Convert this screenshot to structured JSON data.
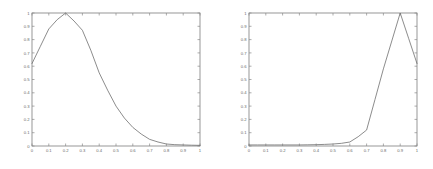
{
  "figure": {
    "background_color": "#ffffff",
    "line_color": "#6e6e6e",
    "axis_color": "#7d7d7d",
    "label_color": "#6a6a6a"
  },
  "chart_data": [
    {
      "type": "line",
      "title": "",
      "xlabel": "",
      "ylabel": "",
      "xlim": [
        0,
        1
      ],
      "ylim": [
        0,
        1
      ],
      "grid": false,
      "legend": null,
      "xticks": [
        "0",
        "0.1",
        "0.2",
        "0.3",
        "0.4",
        "0.5",
        "0.6",
        "0.7",
        "0.8",
        "0.9",
        "1"
      ],
      "yticks": [
        "0",
        "0.1",
        "0.2",
        "0.3",
        "0.4",
        "0.5",
        "0.6",
        "0.7",
        "0.8",
        "0.9",
        "1"
      ],
      "x": [
        0,
        0.05,
        0.1,
        0.15,
        0.2,
        0.25,
        0.3,
        0.35,
        0.4,
        0.45,
        0.5,
        0.55,
        0.6,
        0.65,
        0.7,
        0.75,
        0.8,
        0.85,
        0.9,
        0.95,
        1
      ],
      "values": [
        0.62,
        0.75,
        0.88,
        0.95,
        1.0,
        0.94,
        0.87,
        0.72,
        0.55,
        0.42,
        0.3,
        0.21,
        0.14,
        0.09,
        0.05,
        0.03,
        0.015,
        0.01,
        0.008,
        0.006,
        0.005
      ]
    },
    {
      "type": "line",
      "title": "",
      "xlabel": "",
      "ylabel": "",
      "xlim": [
        0,
        1
      ],
      "ylim": [
        0,
        1
      ],
      "grid": false,
      "legend": null,
      "xticks": [
        "0",
        "0.1",
        "0.2",
        "0.3",
        "0.4",
        "0.5",
        "0.6",
        "0.7",
        "0.8",
        "0.9",
        "1"
      ],
      "yticks": [
        "0",
        "0.1",
        "0.2",
        "0.3",
        "0.4",
        "0.5",
        "0.6",
        "0.7",
        "0.8",
        "0.9",
        "1"
      ],
      "x": [
        0,
        0.05,
        0.1,
        0.15,
        0.2,
        0.25,
        0.3,
        0.35,
        0.4,
        0.45,
        0.5,
        0.55,
        0.6,
        0.65,
        0.7,
        0.75,
        0.8,
        0.85,
        0.9,
        0.95,
        1
      ],
      "values": [
        0.008,
        0.008,
        0.008,
        0.008,
        0.008,
        0.008,
        0.008,
        0.009,
        0.01,
        0.012,
        0.015,
        0.02,
        0.03,
        0.07,
        0.12,
        0.35,
        0.58,
        0.79,
        1.0,
        0.81,
        0.62
      ]
    }
  ]
}
